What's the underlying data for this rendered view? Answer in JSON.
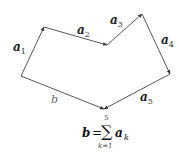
{
  "diagram": {
    "vertices": {
      "origin": [
        21,
        76
      ],
      "p1": [
        44,
        27
      ],
      "p2": [
        107,
        45
      ],
      "p3": [
        142,
        14
      ],
      "p4": [
        170,
        74
      ],
      "p5": [
        104,
        109
      ]
    },
    "vectors": [
      {
        "name": "a1",
        "base": "a",
        "sub": "1",
        "from": "origin",
        "to": "p1",
        "label_pos": [
          13,
          51
        ]
      },
      {
        "name": "a2",
        "base": "a",
        "sub": "2",
        "from": "p1",
        "to": "p2",
        "label_pos": [
          77,
          34
        ]
      },
      {
        "name": "a3",
        "base": "a",
        "sub": "3",
        "from": "p2",
        "to": "p3",
        "label_pos": [
          110,
          24
        ]
      },
      {
        "name": "a4",
        "base": "a",
        "sub": "4",
        "from": "p3",
        "to": "p4",
        "label_pos": [
          161,
          44
        ]
      },
      {
        "name": "a5",
        "base": "a",
        "sub": "5",
        "from": "p4",
        "to": "p5",
        "label_pos": [
          140,
          101
        ]
      }
    ],
    "resultant": {
      "name": "b",
      "label": "b",
      "from": "origin",
      "to": "p5",
      "label_pos": [
        51,
        103
      ]
    },
    "colors": {
      "stroke": "#444444",
      "label": "#222222",
      "resultant_label": "#666666"
    }
  },
  "formula": {
    "lhs": "b",
    "equals": "=",
    "sigma": "∑",
    "upper_limit": "5",
    "lower_limit": "k=1",
    "term": "a",
    "term_sub": "k"
  }
}
